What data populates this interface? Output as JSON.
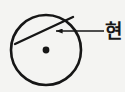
{
  "figure": {
    "background_color": "#f4f4f2",
    "stroke_color": "#161616",
    "label_color": "#161616",
    "circle": {
      "name": "circle-outline",
      "center_x": 46,
      "center_y": 50,
      "radius": 35,
      "stroke_width": 2.6,
      "fill": "none"
    },
    "center_point": {
      "name": "circle-center-dot",
      "x": 46,
      "y": 50,
      "radius": 3.4,
      "fill": "#161616"
    },
    "chord": {
      "name": "chord-line",
      "x1": 15,
      "y1": 44,
      "x2": 73,
      "y2": 17,
      "stroke_width": 2.4
    },
    "leader_arrow": {
      "name": "leader-arrow",
      "tip_x": 55,
      "tip_y": 31,
      "tail_x": 104,
      "tail_y": 31,
      "stroke_width": 1.6,
      "head_length": 7,
      "head_width": 5,
      "direction": "left"
    },
    "label": {
      "name": "chord-label",
      "text": "현",
      "meaning": "chord"
    }
  }
}
